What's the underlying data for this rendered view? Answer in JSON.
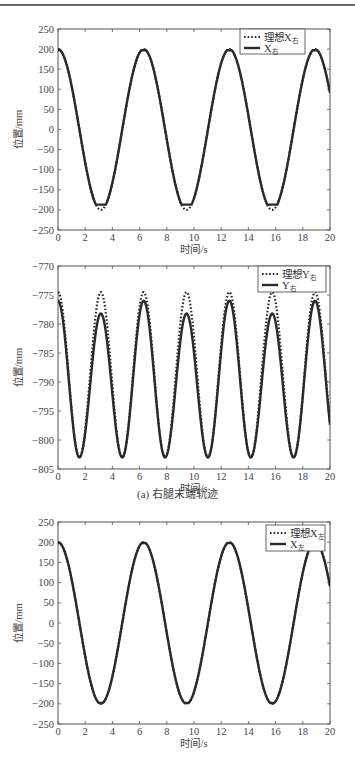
{
  "page": {
    "caption": "(a) 右腿末端轨迹"
  },
  "chart_data": [
    {
      "id": "plot1",
      "type": "line",
      "title": "",
      "xlabel": "时间/s",
      "ylabel": "位置/mm",
      "xlim": [
        0,
        20
      ],
      "ylim": [
        -250,
        250
      ],
      "xticks": [
        0,
        2,
        4,
        6,
        8,
        10,
        12,
        14,
        16,
        18,
        20
      ],
      "yticks": [
        250,
        200,
        150,
        100,
        50,
        0,
        -50,
        -100,
        -150,
        -200,
        -250
      ],
      "grid": false,
      "legend_position": "upper right",
      "legend": [
        {
          "label": "理想X",
          "sub": "右",
          "style": "dotted"
        },
        {
          "label": "X",
          "sub": "右",
          "style": "solid"
        }
      ],
      "series": [
        {
          "name": "理想X右",
          "style": "dotted",
          "model": "cos",
          "amplitude": 200,
          "offset": 0,
          "period": 6.3,
          "clip_min": -200,
          "clip_max": 200,
          "x": [
            0,
            1,
            2,
            3,
            3.15,
            4,
            5,
            6,
            6.3,
            7,
            8,
            9,
            9.45,
            10,
            11,
            12,
            12.6,
            13,
            14,
            15,
            15.75,
            16,
            17,
            18,
            18.9,
            20
          ],
          "values": [
            200,
            109,
            -84,
            -198,
            -200,
            -148,
            43,
            196,
            200,
            158,
            -26,
            -188,
            -200,
            -172,
            7,
            182,
            200,
            185,
            49,
            -152,
            -200,
            -195,
            -84,
            117,
            200,
            99
          ]
        },
        {
          "name": "X右",
          "style": "solid",
          "model": "cos",
          "amplitude": 200,
          "offset": 0,
          "period": 6.3,
          "clip_min": -187,
          "clip_max": 197,
          "x": [
            0,
            1,
            2,
            3,
            3.15,
            4,
            5,
            6,
            6.3,
            7,
            8,
            9,
            9.45,
            10,
            11,
            12,
            12.6,
            13,
            14,
            15,
            15.75,
            16,
            17,
            18,
            18.9,
            20
          ],
          "values": [
            197,
            109,
            -84,
            -187,
            -187,
            -148,
            43,
            196,
            197,
            158,
            -26,
            -187,
            -187,
            -172,
            7,
            182,
            197,
            185,
            49,
            -152,
            -187,
            -187,
            -84,
            117,
            197,
            99
          ]
        }
      ]
    },
    {
      "id": "plot2",
      "type": "line",
      "title": "",
      "xlabel": "时间/s",
      "ylabel": "位置/mm",
      "xlim": [
        0,
        20
      ],
      "ylim": [
        -805,
        -770
      ],
      "xticks": [
        0,
        2,
        4,
        6,
        8,
        10,
        12,
        14,
        16,
        18,
        20
      ],
      "yticks": [
        -770,
        -775,
        -780,
        -785,
        -790,
        -795,
        -800,
        -805
      ],
      "grid": false,
      "legend_position": "upper right",
      "legend": [
        {
          "label": "理想Y",
          "sub": "右",
          "style": "dotted"
        },
        {
          "label": "Y",
          "sub": "右",
          "style": "solid"
        }
      ],
      "series": [
        {
          "name": "理想Y右",
          "style": "dotted",
          "model": "ycurve",
          "peak": -774.5,
          "trough": -803,
          "period": 3.15,
          "x": [
            0,
            1.575,
            3.15,
            4.725,
            6.3,
            7.875,
            9.45,
            11.025,
            12.6,
            14.175,
            15.75,
            17.325,
            18.9,
            20
          ],
          "values": [
            -774.5,
            -803,
            -774.5,
            -803,
            -774.5,
            -803,
            -774.5,
            -803,
            -774.5,
            -803,
            -774.5,
            -803,
            -774.5,
            -797
          ]
        },
        {
          "name": "Y右",
          "style": "solid",
          "model": "ycurve_actual",
          "peak_even": -776,
          "peak_odd": -778.2,
          "trough": -803,
          "period": 3.15,
          "x": [
            0,
            1.575,
            3.3,
            4.725,
            6.35,
            7.875,
            9.5,
            11.025,
            12.7,
            14.175,
            15.85,
            17.325,
            19.0,
            20
          ],
          "values": [
            -776,
            -803,
            -778.2,
            -803,
            -776,
            -803,
            -778.2,
            -803,
            -776,
            -803,
            -778.2,
            -803,
            -776,
            -797
          ]
        }
      ]
    },
    {
      "id": "plot3",
      "type": "line",
      "title": "",
      "xlabel": "时间/s",
      "ylabel": "位置/mm",
      "xlim": [
        0,
        20
      ],
      "ylim": [
        -250,
        250
      ],
      "xticks": [
        0,
        2,
        4,
        6,
        8,
        10,
        12,
        14,
        16,
        18,
        20
      ],
      "yticks": [
        250,
        200,
        150,
        100,
        50,
        0,
        -50,
        -100,
        -150,
        -200,
        -250
      ],
      "grid": false,
      "legend_position": "upper right",
      "legend": [
        {
          "label": "理想X",
          "sub": "左",
          "style": "dotted"
        },
        {
          "label": "X",
          "sub": "左",
          "style": "solid"
        }
      ],
      "series": [
        {
          "name": "理想X左",
          "style": "dotted",
          "model": "cos",
          "amplitude": 200,
          "offset": 0,
          "period": 6.3,
          "clip_min": -200,
          "clip_max": 200,
          "x": [
            0,
            1,
            2,
            3,
            3.15,
            4,
            5,
            6,
            6.3,
            7,
            8,
            9,
            9.45,
            10,
            11,
            12,
            12.6,
            13,
            14,
            15,
            15.75,
            16,
            17,
            18,
            18.9,
            20
          ],
          "values": [
            200,
            109,
            -84,
            -198,
            -200,
            -148,
            43,
            196,
            200,
            158,
            -26,
            -188,
            -200,
            -172,
            7,
            182,
            200,
            185,
            49,
            -152,
            -200,
            -195,
            -84,
            117,
            200,
            99
          ]
        },
        {
          "name": "X左",
          "style": "solid",
          "model": "cos",
          "amplitude": 200,
          "offset": 0,
          "period": 6.3,
          "clip_min": -198,
          "clip_max": 198,
          "x": [
            0,
            1,
            2,
            3,
            3.15,
            4,
            5,
            6,
            6.3,
            7,
            8,
            9,
            9.45,
            10,
            11,
            12,
            12.6,
            13,
            14,
            15,
            15.75,
            16,
            17,
            18,
            18.9,
            20
          ],
          "values": [
            198,
            109,
            -84,
            -197,
            -198,
            -148,
            43,
            196,
            198,
            158,
            -26,
            -188,
            -198,
            -172,
            7,
            182,
            198,
            185,
            49,
            -152,
            -198,
            -195,
            -84,
            117,
            198,
            99
          ]
        }
      ]
    }
  ],
  "layout": {
    "plots": [
      {
        "left": 58,
        "right": 330,
        "top": 29,
        "bottom": 230,
        "legend": {
          "x": 240,
          "y": 29,
          "w": 65,
          "h": 25
        }
      },
      {
        "left": 58,
        "right": 330,
        "top": 266,
        "bottom": 469,
        "legend": {
          "x": 258,
          "y": 266,
          "w": 68,
          "h": 26
        }
      },
      {
        "left": 58,
        "right": 330,
        "top": 522,
        "bottom": 724,
        "legend": {
          "x": 266,
          "y": 525,
          "w": 59,
          "h": 26
        }
      }
    ],
    "line_color": "#2a2a2a",
    "axis_color": "#555555"
  }
}
